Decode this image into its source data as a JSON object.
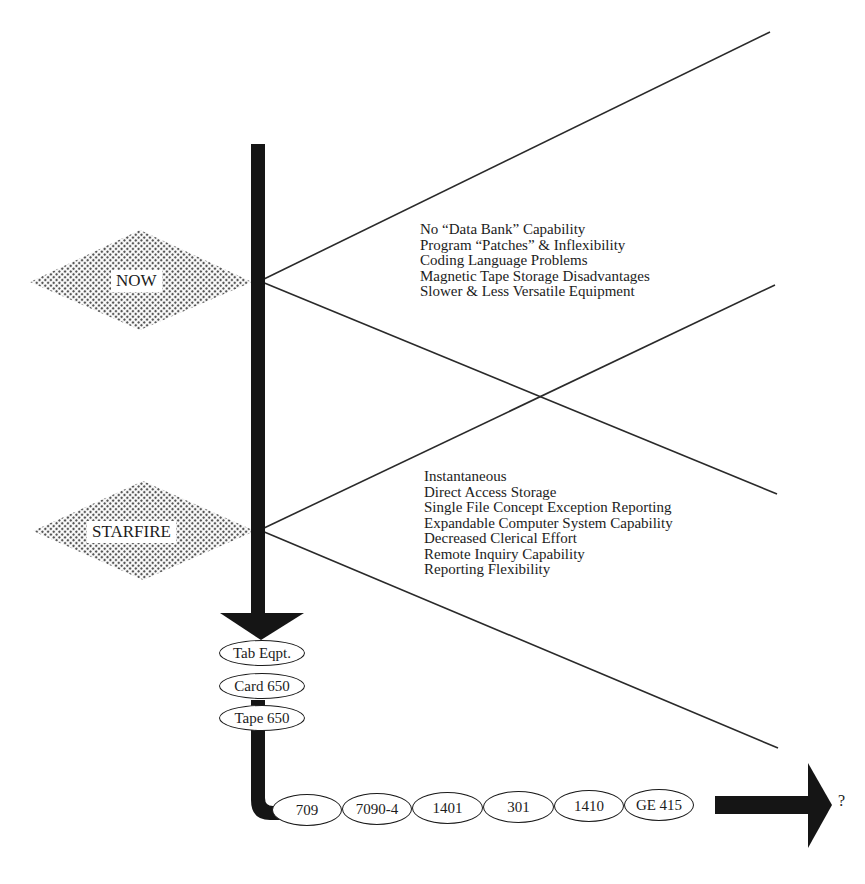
{
  "diagram": {
    "type": "timeline-comparison",
    "markers": [
      {
        "label": "NOW",
        "pattern": "dotted-diamond"
      },
      {
        "label": "STARFIRE",
        "pattern": "dotted-diamond"
      }
    ],
    "now_list": [
      "No “Data Bank” Capability",
      "Program “Patches” & Inflexibility",
      "Coding Language Problems",
      "Magnetic Tape Storage Disadvantages",
      "Slower & Less Versatile Equipment"
    ],
    "starfire_list": [
      "Instantaneous",
      "Direct Access Storage",
      "Single File Concept Exception Reporting",
      "Expandable Computer System Capability",
      "Decreased Clerical Effort",
      "Remote Inquiry Capability",
      "Reporting Flexibility"
    ],
    "vertical_systems": [
      "Tab Eqpt.",
      "Card 650",
      "Tape 650"
    ],
    "horizontal_systems": [
      "709",
      "7090-4",
      "1401",
      "301",
      "1410",
      "GE 415"
    ],
    "end_label": "?",
    "colors": {
      "line": "#1a1a1a",
      "dots": "#555555",
      "background": "#ffffff"
    }
  }
}
